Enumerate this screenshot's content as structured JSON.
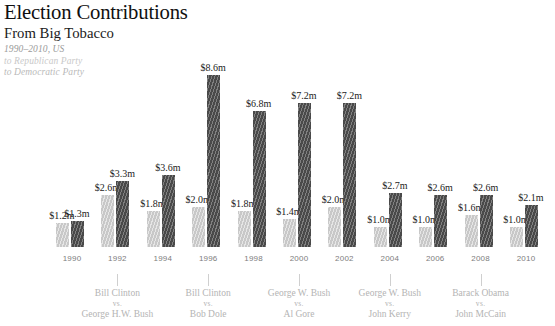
{
  "header": {
    "title_main": "Election Contributions",
    "title_sub": "From Big Tobacco",
    "range": "1990–2010, US",
    "legend_republican": "to Republican Party",
    "legend_democratic": "to Democratic Party"
  },
  "colors": {
    "republican": "#c8c8c8",
    "democratic": "#494949",
    "label": "#1c1c1c",
    "year": "#7d7d7d",
    "matchup": "#b4b4b4"
  },
  "chart_data": {
    "type": "bar",
    "title": "Election Contributions From Big Tobacco",
    "subtitle": "1990–2010, US",
    "xlabel": "",
    "ylabel": "",
    "ylim": [
      0,
      8.6
    ],
    "grid": false,
    "legend_position": "top-left",
    "unit": "$ millions",
    "categories": [
      "1990",
      "1992",
      "1994",
      "1996",
      "1998",
      "2000",
      "2002",
      "2004",
      "2006",
      "2008",
      "2010"
    ],
    "series": [
      {
        "name": "to Republican Party",
        "color": "#c8c8c8",
        "values": [
          1.2,
          2.6,
          1.8,
          2.0,
          1.8,
          1.4,
          2.0,
          1.0,
          1.0,
          1.6,
          1.0
        ],
        "labels": [
          "$1.2m",
          "$2.6m",
          "$1.8m",
          "$2.0m",
          "$1.8m",
          "$1.4m",
          "$2.0m",
          "$1.0m",
          "$1.0m",
          "$1.6m",
          "$1.0m"
        ]
      },
      {
        "name": "to Democratic Party",
        "color": "#494949",
        "values": [
          1.3,
          3.3,
          3.6,
          8.6,
          6.8,
          7.2,
          7.2,
          2.7,
          2.6,
          2.6,
          2.1
        ],
        "labels": [
          "$1.3m",
          "$3.3m",
          "$3.6m",
          "$8.6m",
          "$6.8m",
          "$7.2m",
          "$7.2m",
          "$2.7m",
          "$2.6m",
          "$2.6m",
          "$2.1m"
        ]
      }
    ],
    "annotations": [
      {
        "year": "1992",
        "winner": "Bill Clinton",
        "vs": "vs.",
        "challenger": "George H.W. Bush"
      },
      {
        "year": "1996",
        "winner": "Bill Clinton",
        "vs": "vs.",
        "challenger": "Bob Dole"
      },
      {
        "year": "2000",
        "winner": "George W. Bush",
        "vs": "vs.",
        "challenger": "Al Gore"
      },
      {
        "year": "2004",
        "winner": "George W. Bush",
        "vs": "vs.",
        "challenger": "John Kerry"
      },
      {
        "year": "2008",
        "winner": "Barack Obama",
        "vs": "vs.",
        "challenger": "John McCain"
      }
    ]
  }
}
